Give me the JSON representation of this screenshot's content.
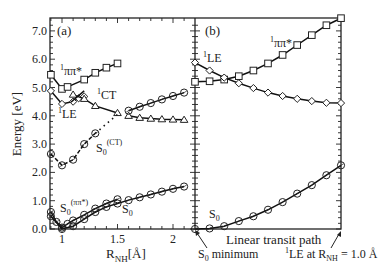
{
  "figure": {
    "ylabel": "Energy [eV]",
    "yticks": [
      "0.0",
      "1.0",
      "2.0",
      "3.0",
      "4.0",
      "5.0",
      "6.0",
      "7.0"
    ],
    "panel_a": {
      "tag": "(a)",
      "xlabel_main": "R",
      "xlabel_sub": "NH",
      "xlabel_unit": "[Å]",
      "xticks": [
        "1",
        "1.5",
        "2"
      ]
    },
    "panel_b": {
      "tag": "(b)",
      "xlabel": "Linear transit path",
      "left_annotation_main": "S",
      "left_annotation_sub": "0",
      "left_annotation_rest": " minimum",
      "right_annotation_sup": "1",
      "right_annotation_main": "LE at  R",
      "right_annotation_sub": "NH",
      "right_annotation_rest": " = 1.0 Å"
    },
    "curve_labels": {
      "pipi": {
        "sup": "1",
        "text": "ππ*"
      },
      "le_a": {
        "sup": "1",
        "text": "LE"
      },
      "ct": {
        "sup": "1",
        "text": "CT"
      },
      "s0ct": {
        "text": "S",
        "sub": "0",
        "sup": "(CT)"
      },
      "s0pipi": {
        "text": "S",
        "sub": "0",
        "sup": "(ππ*)"
      },
      "s0_a": {
        "text": "S",
        "sub": "0"
      },
      "le_b": {
        "sup": "1",
        "text": "LE"
      },
      "pipi_b": {
        "sup": "1",
        "text": "ππ*"
      },
      "s0_b": {
        "text": "S",
        "sub": "0"
      }
    }
  },
  "chart_data": [
    {
      "type": "line",
      "title": "(a)",
      "xlabel": "R_NH [Å]",
      "ylabel": "Energy [eV]",
      "xlim": [
        0.89,
        2.2
      ],
      "ylim": [
        0,
        7.4
      ],
      "xticks": [
        1,
        1.5,
        2
      ],
      "yticks": [
        0,
        1,
        2,
        3,
        4,
        5,
        6,
        7
      ],
      "series": [
        {
          "name": "1ππ*",
          "marker": "square",
          "x": [
            0.9,
            1.0,
            1.05,
            1.2,
            1.3,
            1.4,
            1.5
          ],
          "y": [
            5.45,
            4.95,
            5.02,
            5.28,
            5.52,
            5.7,
            5.85
          ]
        },
        {
          "name": "1LE",
          "marker": "diamond",
          "x": [
            0.9,
            1.0,
            1.1,
            1.15,
            1.2
          ],
          "y": [
            4.88,
            4.42,
            4.5,
            4.62,
            4.68
          ]
        },
        {
          "name": "1CT (left branch)",
          "marker": "triangle",
          "x": [
            1.1,
            1.2,
            1.3,
            1.5
          ],
          "y": [
            4.75,
            4.6,
            4.35,
            4.1
          ]
        },
        {
          "name": "1CT (right branch)",
          "marker": "triangle",
          "x": [
            1.6,
            1.7,
            1.8,
            1.9,
            2.0,
            2.1
          ],
          "y": [
            4.0,
            3.93,
            3.9,
            3.88,
            3.87,
            3.86
          ]
        },
        {
          "name": "S0(CT) upper",
          "marker": "circle",
          "x": [
            1.6,
            1.7,
            1.8,
            1.9,
            2.0,
            2.1
          ],
          "y": [
            4.18,
            4.32,
            4.45,
            4.58,
            4.7,
            4.82
          ]
        },
        {
          "name": "S0(CT)",
          "marker": "circle",
          "x": [
            0.9,
            1.0,
            1.1,
            1.2,
            1.3
          ],
          "y": [
            2.65,
            2.25,
            2.45,
            3.0,
            3.38
          ],
          "dotted_extension_to": [
            1.5,
            4.05
          ]
        },
        {
          "name": "S0(ππ*)",
          "marker": "circle",
          "x": [
            0.9,
            0.95,
            1.0,
            1.05,
            1.1,
            1.2,
            1.3,
            1.4,
            1.5
          ],
          "y": [
            0.6,
            0.25,
            0.05,
            0.18,
            0.3,
            0.5,
            0.72,
            0.9,
            1.05
          ]
        },
        {
          "name": "S0",
          "marker": "circle",
          "x": [
            0.9,
            1.0,
            1.1,
            1.2,
            1.3,
            1.4,
            1.5,
            1.6,
            1.7,
            1.8,
            1.9,
            2.0,
            2.1
          ],
          "y": [
            0.45,
            0.0,
            0.1,
            0.35,
            0.6,
            0.78,
            0.9,
            1.02,
            1.12,
            1.22,
            1.32,
            1.42,
            1.5
          ]
        }
      ]
    },
    {
      "type": "line",
      "title": "(b)",
      "xlabel": "Linear transit path",
      "ylabel": "Energy [eV]",
      "ylim": [
        0,
        7.4
      ],
      "x": [
        0,
        1,
        2,
        3,
        4,
        5,
        6,
        7,
        8,
        9,
        10
      ],
      "x_annotations": {
        "0": "S0 minimum",
        "10": "1LE at R_NH = 1.0 Å"
      },
      "series": [
        {
          "name": "1ππ*",
          "marker": "square",
          "y": [
            5.2,
            5.22,
            5.28,
            5.4,
            5.6,
            5.85,
            6.15,
            6.5,
            6.85,
            7.2,
            7.45
          ]
        },
        {
          "name": "1LE",
          "marker": "diamond",
          "y": [
            5.88,
            5.6,
            5.35,
            5.15,
            4.98,
            4.82,
            4.7,
            4.6,
            4.52,
            4.46,
            4.45
          ]
        },
        {
          "name": "S0",
          "marker": "circle",
          "y": [
            0.0,
            0.02,
            0.1,
            0.28,
            0.45,
            0.68,
            0.95,
            1.25,
            1.55,
            1.9,
            2.25
          ]
        }
      ]
    }
  ]
}
